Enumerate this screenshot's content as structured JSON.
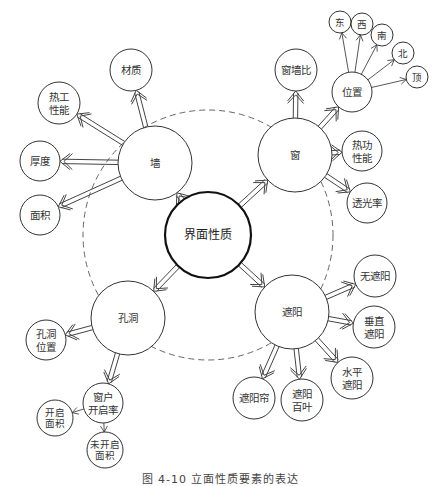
{
  "diagram": {
    "center": {
      "id": "interface",
      "label": "界面性质",
      "x": 208,
      "y": 235,
      "r": 43
    },
    "dashed_ring": {
      "x": 208,
      "y": 235,
      "r": 125
    },
    "primary": [
      {
        "id": "wall",
        "label": "墙",
        "x": 155,
        "y": 163,
        "r": 37
      },
      {
        "id": "window",
        "label": "窗",
        "x": 295,
        "y": 155,
        "r": 37
      },
      {
        "id": "opening",
        "label": "孔洞",
        "x": 128,
        "y": 318,
        "r": 37
      },
      {
        "id": "shading",
        "label": "遮阳",
        "x": 292,
        "y": 312,
        "r": 37
      }
    ],
    "secondary": [
      {
        "id": "wall-material",
        "parent": "wall",
        "lines": [
          "材质"
        ],
        "x": 131,
        "y": 70,
        "r": 21
      },
      {
        "id": "wall-thermal",
        "parent": "wall",
        "lines": [
          "热工",
          "性能"
        ],
        "x": 59,
        "y": 103,
        "r": 21
      },
      {
        "id": "wall-thickness",
        "parent": "wall",
        "lines": [
          "厚度"
        ],
        "x": 40,
        "y": 161,
        "r": 20
      },
      {
        "id": "wall-area",
        "parent": "wall",
        "lines": [
          "面积"
        ],
        "x": 40,
        "y": 215,
        "r": 20
      },
      {
        "id": "window-wall-ratio",
        "parent": "window",
        "lines": [
          "窗墙比"
        ],
        "x": 296,
        "y": 70,
        "r": 21
      },
      {
        "id": "window-position",
        "parent": "window",
        "lines": [
          "位置"
        ],
        "x": 352,
        "y": 92,
        "r": 20
      },
      {
        "id": "window-thermal",
        "parent": "window",
        "lines": [
          "热功",
          "性能"
        ],
        "x": 362,
        "y": 151,
        "r": 20
      },
      {
        "id": "window-transmittance",
        "parent": "window",
        "lines": [
          "透光率"
        ],
        "x": 367,
        "y": 203,
        "r": 20
      },
      {
        "id": "opening-position",
        "parent": "opening",
        "lines": [
          "孔洞",
          "位置"
        ],
        "x": 46,
        "y": 340,
        "r": 20
      },
      {
        "id": "opening-rate",
        "parent": "opening",
        "lines": [
          "窗户",
          "开启率"
        ],
        "x": 103,
        "y": 403,
        "r": 20
      },
      {
        "id": "no-shading",
        "parent": "shading",
        "lines": [
          "无遮阳"
        ],
        "x": 375,
        "y": 276,
        "r": 21
      },
      {
        "id": "vertical-shading",
        "parent": "shading",
        "lines": [
          "垂直",
          "遮阳"
        ],
        "x": 374,
        "y": 327,
        "r": 21
      },
      {
        "id": "horizontal-shading",
        "parent": "shading",
        "lines": [
          "水平",
          "遮阳"
        ],
        "x": 352,
        "y": 378,
        "r": 21
      },
      {
        "id": "shade-curtain",
        "parent": "shading",
        "lines": [
          "遮阳帘"
        ],
        "x": 254,
        "y": 398,
        "r": 21
      },
      {
        "id": "shade-louver",
        "parent": "shading",
        "lines": [
          "遮阳",
          "百叶"
        ],
        "x": 302,
        "y": 400,
        "r": 21
      }
    ],
    "tertiary": [
      {
        "id": "pos-east",
        "parent": "window-position",
        "lines": [
          "东"
        ],
        "x": 340,
        "y": 22,
        "r": 11
      },
      {
        "id": "pos-west",
        "parent": "window-position",
        "lines": [
          "西"
        ],
        "x": 362,
        "y": 24,
        "r": 11
      },
      {
        "id": "pos-south",
        "parent": "window-position",
        "lines": [
          "南"
        ],
        "x": 382,
        "y": 35,
        "r": 11
      },
      {
        "id": "pos-north",
        "parent": "window-position",
        "lines": [
          "北"
        ],
        "x": 403,
        "y": 53,
        "r": 11
      },
      {
        "id": "pos-top",
        "parent": "window-position",
        "lines": [
          "顶"
        ],
        "x": 417,
        "y": 77,
        "r": 11
      },
      {
        "id": "open-area",
        "parent": "opening-rate",
        "lines": [
          "开启",
          "面积"
        ],
        "x": 55,
        "y": 418,
        "r": 18
      },
      {
        "id": "closed-area",
        "parent": "opening-rate",
        "lines": [
          "未开启",
          "面积"
        ],
        "x": 105,
        "y": 450,
        "r": 18
      }
    ]
  },
  "caption": "图 4-10   立面性质要素的表达"
}
